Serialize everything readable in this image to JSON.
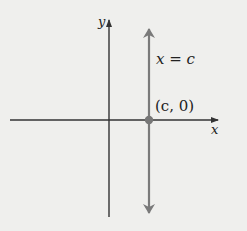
{
  "figure": {
    "type": "coordinate-plane",
    "axes": {
      "x_label": "x",
      "y_label": "y"
    },
    "vertical_line": {
      "equation_label": "x = c",
      "x_value": "c",
      "color": "#7a7a7a",
      "arrows": "both-ends"
    },
    "point": {
      "label": "(c, 0)",
      "coordinates": [
        "c",
        "0"
      ],
      "color": "#777777"
    },
    "colors": {
      "background": "#efefed",
      "axes": "#333333"
    }
  }
}
